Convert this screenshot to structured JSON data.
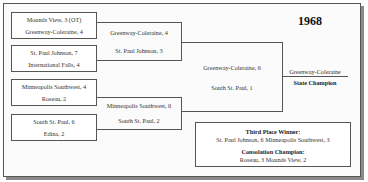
{
  "title": {
    "year": "1968"
  },
  "bracket": {
    "round1": [
      {
        "team1": "Mounds View, 3 (OT)",
        "team2": "Greenway-Coleraine, 4"
      },
      {
        "team1": "St. Paul Johnson, 7",
        "team2": "International Falls, 4"
      },
      {
        "team1": "Minneapolis Southwest, 4",
        "team2": "Roseau, 2"
      },
      {
        "team1": "South St. Paul, 6",
        "team2": "Edina, 2"
      }
    ],
    "semifinals": [
      {
        "team1": "Greenway-Coleraine, 4",
        "team2": "St. Paul Johnson, 3"
      },
      {
        "team1": "Minneapolis Southwest, 0",
        "team2": "South St. Paul, 2"
      }
    ],
    "final": {
      "team1": "Greenway-Coleraine, 6",
      "team2": "South St. Paul, 1"
    },
    "champion": {
      "team": "Greenway-Coleraine",
      "label": "State Champion"
    }
  },
  "results": {
    "third_place_label": "Third Place Winner:",
    "third_place_result": "St. Paul Johnson, 6  Minneapolis Southwest, 3",
    "consolation_label": "Consolation Champion:",
    "consolation_result": "Roseau, 3  Mounds View, 2"
  }
}
